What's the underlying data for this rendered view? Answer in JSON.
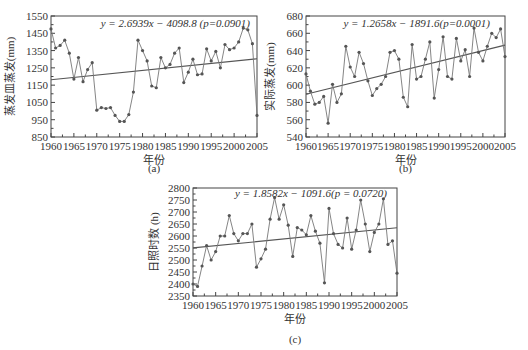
{
  "chart_data": [
    {
      "id": "a",
      "type": "line",
      "caption": "(a)",
      "title": "",
      "xlabel": "年份",
      "ylabel": "蒸发皿蒸发(mm)",
      "equation": "y = 2.6939x − 4098.8 (p=0.0901)",
      "xlim": [
        1960,
        2005
      ],
      "ylim": [
        850,
        1550
      ],
      "xticks": [
        1960,
        1965,
        1970,
        1975,
        1980,
        1985,
        1990,
        1995,
        2000,
        2005
      ],
      "yticks": [
        850,
        950,
        1050,
        1150,
        1250,
        1350,
        1450,
        1550
      ],
      "grid": false,
      "trend": {
        "slope": 2.6939,
        "intercept": -4098.8,
        "p": 0.0901
      },
      "x": [
        1960,
        1961,
        1962,
        1963,
        1964,
        1965,
        1966,
        1967,
        1968,
        1969,
        1970,
        1971,
        1972,
        1973,
        1974,
        1975,
        1976,
        1977,
        1978,
        1979,
        1980,
        1981,
        1982,
        1983,
        1984,
        1985,
        1986,
        1987,
        1988,
        1989,
        1990,
        1991,
        1992,
        1993,
        1994,
        1995,
        1996,
        1997,
        1998,
        1999,
        2000,
        2001,
        2002,
        2003,
        2004,
        2005
      ],
      "series": [
        {
          "name": "蒸发皿蒸发",
          "values": [
            1475,
            1365,
            1380,
            1410,
            1335,
            1185,
            1310,
            1170,
            1240,
            1280,
            1005,
            1020,
            1015,
            1020,
            975,
            940,
            940,
            980,
            1110,
            1410,
            1350,
            1290,
            1145,
            1135,
            1310,
            1250,
            1270,
            1335,
            1365,
            1165,
            1225,
            1300,
            1210,
            1215,
            1360,
            1290,
            1345,
            1250,
            1385,
            1355,
            1365,
            1400,
            1480,
            1470,
            1390,
            975
          ]
        }
      ]
    },
    {
      "id": "b",
      "type": "line",
      "caption": "(b)",
      "title": "",
      "xlabel": "年份",
      "ylabel": "实际蒸发(mm)",
      "equation": "y = 1.2658x − 1891.6(p=0.0001)",
      "xlim": [
        1960,
        2005
      ],
      "ylim": [
        540,
        680
      ],
      "xticks": [
        1960,
        1965,
        1970,
        1975,
        1980,
        1985,
        1990,
        1995,
        2000,
        2005
      ],
      "yticks": [
        540,
        560,
        580,
        600,
        620,
        640,
        660,
        680
      ],
      "grid": false,
      "trend": {
        "slope": 1.2658,
        "intercept": -1891.6,
        "p": 0.0001
      },
      "x": [
        1960,
        1961,
        1962,
        1963,
        1964,
        1965,
        1966,
        1967,
        1968,
        1969,
        1970,
        1971,
        1972,
        1973,
        1974,
        1975,
        1976,
        1977,
        1978,
        1979,
        1980,
        1981,
        1982,
        1983,
        1984,
        1985,
        1986,
        1987,
        1988,
        1989,
        1990,
        1991,
        1992,
        1993,
        1994,
        1995,
        1996,
        1997,
        1998,
        1999,
        2000,
        2001,
        2002,
        2003,
        2004,
        2005
      ],
      "series": [
        {
          "name": "实际蒸发",
          "values": [
            613,
            593,
            578,
            580,
            587,
            556,
            601,
            580,
            590,
            645,
            621,
            610,
            638,
            625,
            605,
            588,
            596,
            601,
            610,
            638,
            640,
            630,
            586,
            575,
            647,
            607,
            610,
            630,
            650,
            585,
            618,
            656,
            610,
            607,
            654,
            628,
            641,
            610,
            666,
            638,
            628,
            645,
            660,
            655,
            665,
            633
          ]
        }
      ]
    },
    {
      "id": "c",
      "type": "line",
      "caption": "(c)",
      "title": "",
      "xlabel": "年份",
      "ylabel": "日照时数 (h)",
      "equation": "y = 1.8582x − 1091.6(p = 0.0720)",
      "xlim": [
        1960,
        2005
      ],
      "ylim": [
        2350,
        2800
      ],
      "xticks": [
        1960,
        1965,
        1970,
        1975,
        1980,
        1985,
        1990,
        1995,
        2000,
        2005
      ],
      "yticks": [
        2350,
        2400,
        2450,
        2500,
        2550,
        2600,
        2650,
        2700,
        2750,
        2800
      ],
      "grid": false,
      "trend": {
        "slope": 1.8582,
        "intercept": -1091.6,
        "p": 0.072
      },
      "x": [
        1960,
        1961,
        1962,
        1963,
        1964,
        1965,
        1966,
        1967,
        1968,
        1969,
        1970,
        1971,
        1972,
        1973,
        1974,
        1975,
        1976,
        1977,
        1978,
        1979,
        1980,
        1981,
        1982,
        1983,
        1984,
        1985,
        1986,
        1987,
        1988,
        1989,
        1990,
        1991,
        1992,
        1993,
        1994,
        1995,
        1996,
        1997,
        1998,
        1999,
        2000,
        2001,
        2002,
        2003,
        2004,
        2005
      ],
      "series": [
        {
          "name": "日照时数",
          "values": [
            2400,
            2390,
            2475,
            2560,
            2500,
            2535,
            2600,
            2600,
            2685,
            2610,
            2580,
            2610,
            2610,
            2650,
            2470,
            2505,
            2545,
            2670,
            2760,
            2670,
            2730,
            2645,
            2515,
            2635,
            2625,
            2605,
            2685,
            2620,
            2570,
            2405,
            2715,
            2610,
            2565,
            2550,
            2675,
            2545,
            2625,
            2750,
            2650,
            2535,
            2615,
            2650,
            2755,
            2565,
            2580,
            2445
          ]
        }
      ]
    }
  ]
}
